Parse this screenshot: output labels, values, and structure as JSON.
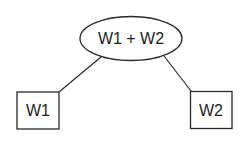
{
  "diagram": {
    "type": "tree",
    "nodes": {
      "root": {
        "label": "W1 + W2",
        "shape": "ellipse"
      },
      "left": {
        "label": "W1",
        "shape": "rectangle"
      },
      "right": {
        "label": "W2",
        "shape": "rectangle"
      }
    },
    "edges": [
      {
        "from": "root",
        "to": "left"
      },
      {
        "from": "root",
        "to": "right"
      }
    ],
    "colors": {
      "stroke": "#2a2a2a",
      "fill": "#ffffff",
      "text": "#1e1e1e"
    }
  }
}
